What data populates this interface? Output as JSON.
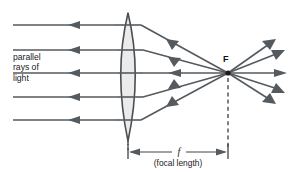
{
  "figure": {
    "background_color": "#ffffff",
    "width": 289,
    "height": 172
  },
  "labels": {
    "incoming_line1": "parallel",
    "incoming_line2": "rays of",
    "incoming_line3": "light",
    "focal_point": "F",
    "focal_length_symbol": "f",
    "focal_length_caption": "(focal length)"
  },
  "colors": {
    "ray": "#555a5e",
    "lens_fill": "#ebebeb",
    "lens_stroke": "#4a4f53",
    "focal_dot": "#1c1c1c",
    "dimension": "#404447",
    "text": "#1a1a1a"
  },
  "geometry": {
    "lens": {
      "center_x": 128,
      "top_y": 13,
      "bottom_y": 141,
      "half_width": 15.5
    },
    "axis_y": 73,
    "focal_point_x": 228,
    "focal_point_y": 73,
    "dimension_y": 152,
    "dimension_from_x": 128,
    "dimension_to_x": 228
  },
  "incoming_rays": [
    {
      "y": 25,
      "start_x": 13,
      "end_x": 114,
      "arrow_x": 78
    },
    {
      "y": 50,
      "start_x": 13,
      "end_x": 117,
      "arrow_x": 78
    },
    {
      "y": 73,
      "start_x": 13,
      "end_x": 118,
      "arrow_x": 78
    },
    {
      "y": 97,
      "start_x": 13,
      "end_x": 117,
      "arrow_x": 78
    },
    {
      "y": 120,
      "start_x": 13,
      "end_x": 114,
      "arrow_x": 78
    }
  ],
  "refracted_rays": [
    {
      "from_x": 141,
      "from_y": 25,
      "to_x": 228,
      "to_y": 73,
      "arrow_t": 0.42
    },
    {
      "from_x": 143,
      "from_y": 50,
      "to_x": 228,
      "to_y": 73,
      "arrow_t": 0.42
    },
    {
      "from_x": 143,
      "from_y": 73,
      "to_x": 228,
      "to_y": 73,
      "arrow_t": 0.42
    },
    {
      "from_x": 143,
      "from_y": 97,
      "to_x": 228,
      "to_y": 73,
      "arrow_t": 0.42
    },
    {
      "from_x": 141,
      "from_y": 120,
      "to_x": 228,
      "to_y": 73,
      "arrow_t": 0.42
    }
  ],
  "diverging_rays": [
    {
      "to_x": 272,
      "to_y": 42
    },
    {
      "to_x": 281,
      "to_y": 52
    },
    {
      "to_x": 283,
      "to_y": 73
    },
    {
      "to_x": 281,
      "to_y": 90
    },
    {
      "to_x": 272,
      "to_y": 101
    }
  ]
}
